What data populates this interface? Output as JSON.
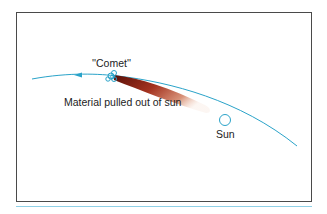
{
  "figure": {
    "labels": {
      "comet": "''Comet''",
      "material": "Material pulled out of sun",
      "sun": "Sun"
    },
    "colors": {
      "orbit": "#2aa3c9",
      "tail_dark": "#7a1a12",
      "tail_light": "#e8b9a0",
      "frame": "#4a4a4a",
      "rule": "#8fd0e6"
    }
  }
}
